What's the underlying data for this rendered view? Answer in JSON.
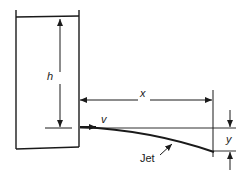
{
  "diagram": {
    "type": "fluid-jet-from-tank",
    "labels": {
      "head": "h",
      "horizontal_distance": "x",
      "velocity": "v",
      "vertical_drop": "y",
      "jet": "Jet"
    },
    "colors": {
      "stroke": "#1a1a1a",
      "background": "#ffffff"
    }
  }
}
